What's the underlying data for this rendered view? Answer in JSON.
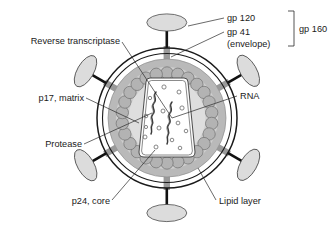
{
  "figure": {
    "background_color": "#ffffff"
  },
  "labels": {
    "gp120": "gp 120",
    "gp41": "gp 41",
    "envelope": "(envelope)",
    "gp160": "gp 160",
    "reverse_transcriptase": "Reverse transcriptase",
    "p17_matrix": "p17, matrix",
    "protease": "Protease",
    "rna": "RNA",
    "p24_core": "p24, core",
    "lipid_layer": "Lipid layer"
  },
  "colors": {
    "outline": "#1a1a1a",
    "leader": "#2a2a2a",
    "matrix_fill": "#b9b9b9",
    "inner_fill": "#cfcfcf",
    "core_fill": "#fbfbfb",
    "bead_fill": "#b3b3b3",
    "bead_stroke": "#6f6f6f",
    "spike_head_fill": "#dcdcdc",
    "spike_head_stroke": "#4a4a4a",
    "spike_stalk": "#9a9a9a",
    "spike_stem": "#111111",
    "rna_stroke": "#3a3a3a",
    "enzyme_stroke": "#6a6a6a"
  },
  "structure": {
    "virion_center": {
      "x": 167,
      "y": 118
    },
    "lipid_layer_radius": 70,
    "matrix_radius": 59,
    "bead_ring_radius": 45,
    "bead_count": 26,
    "bead_radius": 6.2,
    "spike_count": 6,
    "spike_angles_deg": [
      270,
      330,
      30,
      90,
      150,
      210
    ],
    "core_shape": "trapezoid",
    "rna_strand_count": 2,
    "enzyme_dot_count": 14
  }
}
